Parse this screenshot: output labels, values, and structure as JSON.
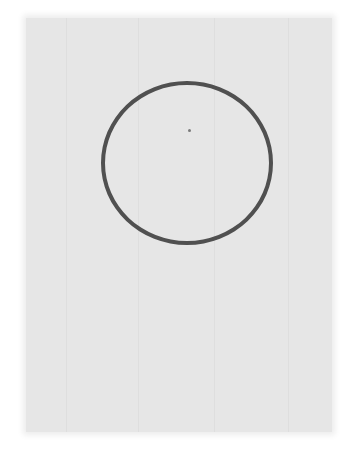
{
  "scene": {
    "description": "Scanned sheet of paper with a hand-drawn circle",
    "paper_color": "#e6e6e6",
    "background_color": "#ffffff",
    "circle": {
      "stroke_color": "#505050",
      "stroke_width": 4,
      "center_x": 187,
      "center_y": 163,
      "radius_x": 86,
      "radius_y": 82
    },
    "center_dot": {
      "x": 189,
      "y": 130,
      "color": "#7a7a7a"
    }
  }
}
